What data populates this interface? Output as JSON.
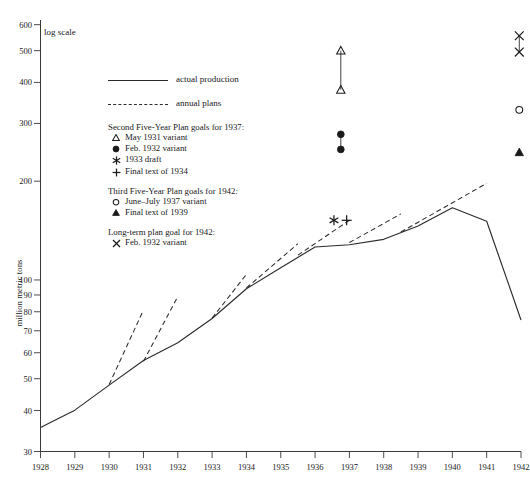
{
  "chart_data": {
    "type": "line",
    "title": "",
    "xlabel": "",
    "ylabel": "million metric tons",
    "scale_note": "log scale",
    "yscale": "log",
    "ylim": [
      30,
      620
    ],
    "xlim": [
      1928,
      1942
    ],
    "grid": false,
    "x": [
      1928,
      1929,
      1930,
      1931,
      1932,
      1933,
      1934,
      1935,
      1936,
      1937,
      1938,
      1939,
      1940,
      1941,
      1942
    ],
    "y_ticks": [
      600,
      500,
      400,
      300,
      200,
      100,
      90,
      80,
      70,
      60,
      50,
      40,
      30
    ],
    "x_ticks": [
      1928,
      1929,
      1930,
      1931,
      1932,
      1933,
      1934,
      1935,
      1936,
      1937,
      1938,
      1939,
      1940,
      1941,
      1942
    ],
    "series": [
      {
        "name": "actual production",
        "style": "solid",
        "x": [
          1928,
          1929,
          1930,
          1931,
          1932,
          1933,
          1934,
          1935,
          1936,
          1937,
          1938,
          1939,
          1940,
          1941,
          1942
        ],
        "values": [
          35.5,
          40.1,
          47.8,
          56.8,
          64.4,
          76.3,
          94.0,
          109.0,
          126.0,
          128.0,
          133.0,
          146.0,
          166.0,
          151.0,
          75.5
        ]
      },
      {
        "name": "annual plans",
        "style": "dashed",
        "segments": [
          {
            "x": [
              1930.0,
              1931.0
            ],
            "values": [
              48.0,
              81.0
            ]
          },
          {
            "x": [
              1931.0,
              1932.0
            ],
            "values": [
              56.5,
              89.0
            ]
          },
          {
            "x": [
              1933.0,
              1934.0
            ],
            "values": [
              76.5,
              104.0
            ]
          },
          {
            "x": [
              1934.0,
              1935.5
            ],
            "values": [
              94.5,
              129.0
            ]
          },
          {
            "x": [
              1935.5,
              1937.0
            ],
            "values": [
              119.0,
              152.0
            ]
          },
          {
            "x": [
              1937.0,
              1938.5
            ],
            "values": [
              130.0,
              159.0
            ]
          },
          {
            "x": [
              1938.5,
              1941.0
            ],
            "values": [
              140.0,
              197.0
            ]
          }
        ]
      }
    ],
    "point_markers": [
      {
        "label": "May 1931 variant",
        "glyph": "open-triangle",
        "x": 1936.75,
        "value": 500.0
      },
      {
        "label": "May 1931 variant",
        "glyph": "open-triangle",
        "x": 1936.75,
        "value": 380.0
      },
      {
        "label": "Feb. 1932 variant",
        "glyph": "filled-circle",
        "x": 1936.75,
        "value": 278.0
      },
      {
        "label": "Feb. 1932 variant",
        "glyph": "filled-circle",
        "x": 1936.75,
        "value": 250.0
      },
      {
        "label": "1933 draft",
        "glyph": "asterisk",
        "x": 1936.55,
        "value": 152.0
      },
      {
        "label": "Final text of 1934",
        "glyph": "plus",
        "x": 1936.92,
        "value": 152.0
      },
      {
        "label": "Feb. 1932 variant (long-term)",
        "glyph": "cross",
        "x": 1941.95,
        "value": 555.0
      },
      {
        "label": "Feb. 1932 variant (long-term)",
        "glyph": "cross",
        "x": 1941.95,
        "value": 495.0
      },
      {
        "label": "June-July 1937 variant",
        "glyph": "open-circle",
        "x": 1941.95,
        "value": 330.0
      },
      {
        "label": "Final text of 1939",
        "glyph": "filled-triangle",
        "x": 1941.95,
        "value": 245.0
      }
    ],
    "connectors": [
      {
        "x": 1936.75,
        "from": 500.0,
        "to": 380.0
      },
      {
        "x": 1936.75,
        "from": 278.0,
        "to": 250.0
      },
      {
        "x": 1941.95,
        "from": 555.0,
        "to": 495.0
      }
    ]
  },
  "legend": {
    "lines": [
      {
        "label": "actual production",
        "style": "solid"
      },
      {
        "label": "annual plans",
        "style": "dashed"
      }
    ],
    "groups": [
      {
        "title": "Second Five-Year Plan goals for 1937:",
        "items": [
          {
            "glyph": "open-triangle",
            "label": "May 1931 variant"
          },
          {
            "glyph": "filled-circle",
            "label": "Feb. 1932 variant"
          },
          {
            "glyph": "asterisk",
            "label": "1933 draft"
          },
          {
            "glyph": "plus",
            "label": "Final text of 1934"
          }
        ]
      },
      {
        "title": "Third Five-Year Plan goals for 1942:",
        "items": [
          {
            "glyph": "open-circle",
            "label": "June–July 1937 variant"
          },
          {
            "glyph": "filled-triangle",
            "label": "Final text of 1939"
          }
        ]
      },
      {
        "title": "Long-term plan goal for 1942:",
        "items": [
          {
            "glyph": "cross",
            "label": "Feb. 1932 variant"
          }
        ]
      }
    ]
  }
}
